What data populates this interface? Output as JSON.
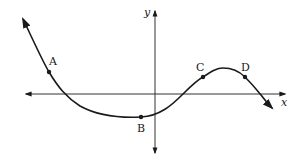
{
  "diagram": {
    "type": "function-graph",
    "axes": {
      "x_label": "x",
      "y_label": "y"
    },
    "points": [
      {
        "label": "A",
        "description": "point on decreasing portion, left of y-axis, above x-axis"
      },
      {
        "label": "B",
        "description": "point near local minimum, just left of y-axis, below x-axis"
      },
      {
        "label": "C",
        "description": "point on increasing portion, right of y-axis, above x-axis"
      },
      {
        "label": "D",
        "description": "point on decreasing portion after local maximum, above x-axis"
      }
    ],
    "colors": {
      "curve": "#1a1a1a",
      "axes": "#333333",
      "background": "#ffffff"
    }
  }
}
